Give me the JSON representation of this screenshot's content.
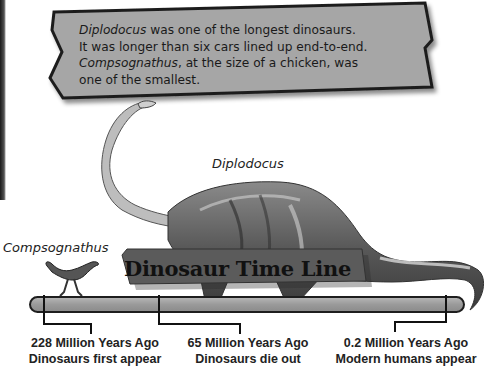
{
  "callout": {
    "line1_italic": "Diplodocus",
    "line1_rest": " was one of the longest dinosaurs.",
    "line2": "It was longer than six cars lined up end-to-end.",
    "line3_italic": "Compsognathus",
    "line3_rest": ", at the size of a chicken, was",
    "line4": "one of the smallest."
  },
  "labels": {
    "diplodocus": "Diplodocus",
    "compsognathus": "Compsognathus"
  },
  "timeline": {
    "title": "Dinosaur Time Line",
    "events": [
      {
        "when": "228 Million Years Ago",
        "what": "Dinosaurs first appear"
      },
      {
        "when": "65 Million Years Ago",
        "what": "Dinosaurs die out"
      },
      {
        "when": "0.2 Million Years Ago",
        "what": "Modern humans appear"
      }
    ]
  },
  "colors": {
    "callout_fill": "#a6a6a6",
    "callout_border": "#1e1e1e",
    "bar_fill": "#9c9c9c",
    "sign_fill": "#5a5a5a",
    "dino_dark": "#4a4a4a",
    "dino_light": "#c8c8c8"
  }
}
